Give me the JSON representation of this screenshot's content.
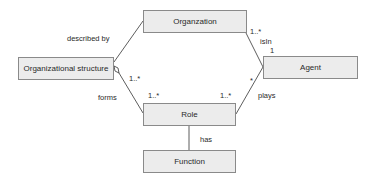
{
  "diagram": {
    "type": "uml-class-diagram",
    "classes": [
      {
        "id": "organization",
        "label": "Organzation"
      },
      {
        "id": "org_structure",
        "label": "Organizational structure"
      },
      {
        "id": "agent",
        "label": "Agent"
      },
      {
        "id": "role",
        "label": "Role"
      },
      {
        "id": "function",
        "label": "Function"
      }
    ],
    "associations": [
      {
        "from": "org_structure",
        "to": "organization",
        "label": "described by",
        "aggregation_at": "org_structure"
      },
      {
        "from": "organization",
        "to": "agent",
        "label": "isIn",
        "multiplicity_from": "1..*",
        "multiplicity_to": "1",
        "aggregation_at": "organization"
      },
      {
        "from": "org_structure",
        "to": "role",
        "label": "forms",
        "multiplicity_from": "1..*",
        "multiplicity_to": "1..*",
        "aggregation_at": "org_structure"
      },
      {
        "from": "agent",
        "to": "role",
        "label": "plays",
        "multiplicity_from": "*",
        "multiplicity_to": "1..*"
      },
      {
        "from": "role",
        "to": "function",
        "label": "has"
      }
    ]
  },
  "labels": {
    "described_by": "described by",
    "isin": "isIn",
    "isin_mult_org": "1..*",
    "isin_mult_agent": "1",
    "forms": "forms",
    "forms_mult_struct": "1..*",
    "forms_mult_role": "1..*",
    "plays": "plays",
    "plays_mult_agent": "*",
    "plays_mult_role": "1..*",
    "has": "has"
  }
}
